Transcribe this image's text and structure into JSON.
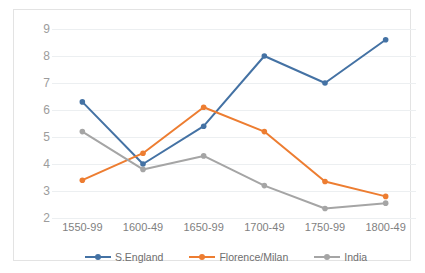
{
  "chart_data": {
    "type": "line",
    "title": "",
    "subtitle": "",
    "xlabel": "",
    "ylabel": "",
    "categories": [
      "1550-99",
      "1600-49",
      "1650-99",
      "1700-49",
      "1750-99",
      "1800-49"
    ],
    "series": [
      {
        "name": "S.England",
        "color": "#4472A4",
        "marker": "circle",
        "values": [
          6.3,
          4.0,
          5.4,
          8.0,
          7.0,
          8.6
        ]
      },
      {
        "name": "Florence/Milan",
        "color": "#ED7D31",
        "marker": "circle",
        "values": [
          3.4,
          4.4,
          6.1,
          5.2,
          3.35,
          2.8
        ]
      },
      {
        "name": "India",
        "color": "#A5A5A5",
        "marker": "circle",
        "values": [
          5.2,
          3.8,
          4.3,
          3.2,
          2.35,
          2.55
        ]
      }
    ],
    "ylim": [
      2,
      9
    ],
    "yticks": [
      2,
      3,
      4,
      5,
      6,
      7,
      8,
      9
    ],
    "ytick_labels": [
      "2",
      "3",
      "4",
      "5",
      "6",
      "7",
      "8",
      "9"
    ],
    "grid": "horizontal",
    "legend_position": "bottom",
    "legend_entries": [
      "S.England",
      "Florence/Milan",
      "India"
    ],
    "colors": {
      "series_1": "#4472A4",
      "series_2": "#ED7D31",
      "series_3": "#A5A5A5",
      "gridline": "#ECEFF1",
      "axis_text": "#9C9C9C",
      "frame": "#E3E3E3",
      "background": "#FFFFFF"
    }
  }
}
